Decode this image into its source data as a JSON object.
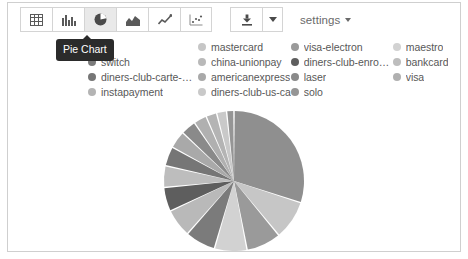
{
  "window": {
    "title": "Pie Chart Visualization Panel",
    "background": "#ffffff",
    "border_color": "#cfcfcf"
  },
  "toolbar": {
    "chart_type_buttons": [
      {
        "name": "table-view",
        "label": "Table",
        "icon": "table-icon",
        "active": false
      },
      {
        "name": "bar-chart",
        "label": "Bar Chart",
        "icon": "bar-chart-icon",
        "active": false
      },
      {
        "name": "pie-chart",
        "label": "Pie Chart",
        "icon": "pie-chart-icon",
        "active": true
      },
      {
        "name": "area-chart",
        "label": "Area Chart",
        "icon": "area-chart-icon",
        "active": false
      },
      {
        "name": "line-chart",
        "label": "Line Chart",
        "icon": "line-chart-icon",
        "active": false
      },
      {
        "name": "scatter-chart",
        "label": "Scatter Chart",
        "icon": "scatter-chart-icon",
        "active": false
      }
    ],
    "download_button": {
      "label": "Download",
      "icon": "download-icon"
    },
    "download_caret": {
      "label": "Download options",
      "icon": "caret-down-icon"
    },
    "settings": {
      "label": "settings",
      "icon": "caret-down-icon"
    }
  },
  "tooltip": {
    "text": "Pie Chart",
    "background": "#2b2b2b",
    "color": "#ffffff"
  },
  "legend": {
    "columns": [
      [
        {
          "label": "jcb",
          "color": "#8f8f8f"
        },
        {
          "label": "switch",
          "color": "#7b7b7b"
        },
        {
          "label": "diners-club-carte-bl...",
          "color": "#767676"
        },
        {
          "label": "instapayment",
          "color": "#b4b4b4"
        }
      ],
      [
        {
          "label": "mastercard",
          "color": "#c6c6c6"
        },
        {
          "label": "china-unionpay",
          "color": "#b9b9b9"
        },
        {
          "label": "americanexpress",
          "color": "#a9a9a9"
        },
        {
          "label": "diners-club-us-ca",
          "color": "#c9c9c9"
        }
      ],
      [
        {
          "label": "visa-electron",
          "color": "#9a9a9a"
        },
        {
          "label": "diners-club-enroute",
          "color": "#5e5e5e"
        },
        {
          "label": "laser",
          "color": "#8a8a8a"
        },
        {
          "label": "solo",
          "color": "#959595"
        }
      ],
      [
        {
          "label": "maestro",
          "color": "#d2d2d2"
        },
        {
          "label": "bankcard",
          "color": "#bdbdbd"
        },
        {
          "label": "visa",
          "color": "#b0b0b0"
        }
      ]
    ]
  },
  "chart_data": {
    "type": "pie",
    "title": "Pie Chart",
    "xlabel": "",
    "ylabel": "",
    "legend_position": "top",
    "grid": false,
    "center": {
      "cx": 77,
      "cy": 72
    },
    "radius": 70,
    "start_angle_deg": -90,
    "categories": [
      "jcb",
      "mastercard",
      "visa-electron",
      "maestro",
      "switch",
      "china-unionpay",
      "diners-club-enroute",
      "bankcard",
      "diners-club-carte-bl...",
      "americanexpress",
      "laser",
      "visa",
      "instapayment",
      "diners-club-us-ca",
      "solo"
    ],
    "values": [
      30.0,
      9.0,
      8.0,
      7.5,
      7.0,
      6.5,
      5.5,
      5.0,
      4.5,
      4.0,
      3.5,
      3.0,
      2.5,
      2.3,
      1.7
    ],
    "colors": [
      "#8f8f8f",
      "#c6c6c6",
      "#9a9a9a",
      "#d2d2d2",
      "#7b7b7b",
      "#b9b9b9",
      "#5e5e5e",
      "#bdbdbd",
      "#767676",
      "#a9a9a9",
      "#8a8a8a",
      "#b0b0b0",
      "#b4b4b4",
      "#c9c9c9",
      "#959595"
    ],
    "slice_gap_deg": 1.2
  }
}
